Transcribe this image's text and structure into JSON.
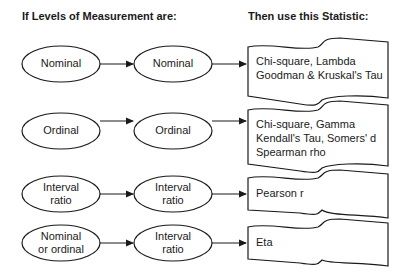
{
  "headers": {
    "left": "If Levels of Measurement are:",
    "right": "Then use this Statistic:"
  },
  "rows": [
    {
      "first": [
        "Nominal"
      ],
      "second": [
        "Nominal"
      ],
      "statistics": [
        "Chi-square, Lambda",
        "Goodman & Kruskal's Tau"
      ]
    },
    {
      "first": [
        "Ordinal"
      ],
      "second": [
        "Ordinal"
      ],
      "statistics": [
        "Chi-square, Gamma",
        "Kendall's Tau, Somers' d",
        "Spearman rho"
      ]
    },
    {
      "first": [
        "Interval",
        "ratio"
      ],
      "second": [
        "Interval",
        "ratio"
      ],
      "statistics": [
        "Pearson r"
      ]
    },
    {
      "first": [
        "Nominal",
        "or ordinal"
      ],
      "second": [
        "Interval",
        "ratio"
      ],
      "statistics": [
        "Eta"
      ]
    }
  ],
  "colors": {
    "stroke": "#1a1a1a",
    "background": "#ffffff"
  }
}
